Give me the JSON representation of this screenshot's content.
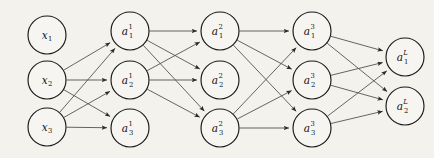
{
  "diagram": {
    "type": "neural-network-graph",
    "title": "",
    "background_color": "#f4f2ed",
    "node_fill_color": "#f7f5f1",
    "node_stroke_color": "#1a1a1a",
    "edge_color": "#4a4a4a",
    "label_color": "#111111",
    "node_radius": 19,
    "layers": [
      {
        "id": "input",
        "name": "input-layer",
        "x": 47,
        "nodes": [
          {
            "id": "x1",
            "name": "node-x1",
            "base": "x",
            "sub": "1",
            "sup": "",
            "cx": 47,
            "cy": 35
          },
          {
            "id": "x2",
            "name": "node-x2",
            "base": "x",
            "sub": "2",
            "sup": "",
            "cx": 47,
            "cy": 80
          },
          {
            "id": "x3",
            "name": "node-x3",
            "base": "x",
            "sub": "3",
            "sup": "",
            "cx": 47,
            "cy": 127
          }
        ]
      },
      {
        "id": "hidden1",
        "name": "hidden-layer-1",
        "x": 130,
        "nodes": [
          {
            "id": "a1_1",
            "name": "node-a1-layer1",
            "base": "a",
            "sub": "1",
            "sup": "1",
            "cx": 130,
            "cy": 31
          },
          {
            "id": "a2_1",
            "name": "node-a2-layer1",
            "base": "a",
            "sub": "2",
            "sup": "1",
            "cx": 130,
            "cy": 80
          },
          {
            "id": "a3_1",
            "name": "node-a3-layer1",
            "base": "a",
            "sub": "3",
            "sup": "1",
            "cx": 130,
            "cy": 128
          }
        ]
      },
      {
        "id": "hidden2",
        "name": "hidden-layer-2",
        "x": 220,
        "nodes": [
          {
            "id": "a1_2",
            "name": "node-a1-layer2",
            "base": "a",
            "sub": "1",
            "sup": "2",
            "cx": 220,
            "cy": 31
          },
          {
            "id": "a2_2",
            "name": "node-a2-layer2",
            "base": "a",
            "sub": "2",
            "sup": "2",
            "cx": 220,
            "cy": 80
          },
          {
            "id": "a3_2",
            "name": "node-a3-layer2",
            "base": "a",
            "sub": "3",
            "sup": "2",
            "cx": 220,
            "cy": 128
          }
        ]
      },
      {
        "id": "hidden3",
        "name": "hidden-layer-3",
        "x": 312,
        "nodes": [
          {
            "id": "a1_3",
            "name": "node-a1-layer3",
            "base": "a",
            "sub": "1",
            "sup": "3",
            "cx": 312,
            "cy": 31
          },
          {
            "id": "a2_3",
            "name": "node-a2-layer3",
            "base": "a",
            "sub": "2",
            "sup": "3",
            "cx": 312,
            "cy": 80
          },
          {
            "id": "a3_3",
            "name": "node-a3-layer3",
            "base": "a",
            "sub": "3",
            "sup": "3",
            "cx": 312,
            "cy": 128
          }
        ]
      },
      {
        "id": "output",
        "name": "output-layer",
        "x": 405,
        "nodes": [
          {
            "id": "a1_L",
            "name": "node-a1-output",
            "base": "a",
            "sub": "1",
            "sup": "L",
            "sup_italic": true,
            "cx": 405,
            "cy": 57
          },
          {
            "id": "a2_L",
            "name": "node-a2-output",
            "base": "a",
            "sub": "2",
            "sup": "L",
            "sup_italic": true,
            "cx": 405,
            "cy": 106
          }
        ]
      }
    ],
    "edges": [
      {
        "from": "x2",
        "to": "a1_1"
      },
      {
        "from": "x2",
        "to": "a2_1"
      },
      {
        "from": "x2",
        "to": "a3_1"
      },
      {
        "from": "x3",
        "to": "a1_1"
      },
      {
        "from": "x3",
        "to": "a2_1"
      },
      {
        "from": "x3",
        "to": "a3_1"
      },
      {
        "from": "a1_1",
        "to": "a1_2"
      },
      {
        "from": "a1_1",
        "to": "a2_2"
      },
      {
        "from": "a1_1",
        "to": "a3_2"
      },
      {
        "from": "a2_1",
        "to": "a1_2"
      },
      {
        "from": "a2_1",
        "to": "a2_2"
      },
      {
        "from": "a2_1",
        "to": "a3_2"
      },
      {
        "from": "a1_2",
        "to": "a1_3"
      },
      {
        "from": "a1_2",
        "to": "a2_3"
      },
      {
        "from": "a1_2",
        "to": "a3_3"
      },
      {
        "from": "a3_2",
        "to": "a1_3"
      },
      {
        "from": "a3_2",
        "to": "a2_3"
      },
      {
        "from": "a3_2",
        "to": "a3_3"
      },
      {
        "from": "a1_3",
        "to": "a1_L"
      },
      {
        "from": "a1_3",
        "to": "a2_L"
      },
      {
        "from": "a2_3",
        "to": "a1_L"
      },
      {
        "from": "a2_3",
        "to": "a2_L"
      },
      {
        "from": "a3_3",
        "to": "a1_L"
      },
      {
        "from": "a3_3",
        "to": "a2_L"
      }
    ]
  }
}
